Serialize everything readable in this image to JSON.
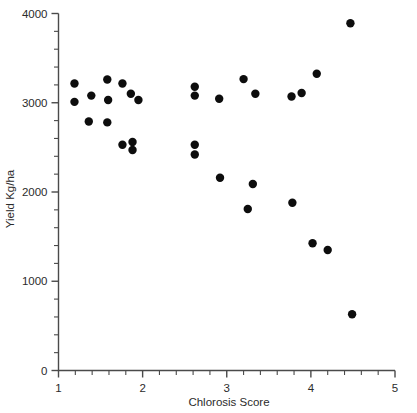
{
  "chart_data": {
    "type": "scatter",
    "title": "",
    "xlabel": "Chlorosis Score",
    "ylabel": "Yield Kg/ha",
    "xlim": [
      1,
      5
    ],
    "ylim": [
      0,
      4000
    ],
    "x_ticks_major": [
      1,
      2,
      3,
      4,
      5
    ],
    "x_tick_labels": [
      "1",
      "2",
      "3",
      "4",
      "5"
    ],
    "x_minor_step": 0.2,
    "y_ticks_major": [
      0,
      1000,
      2000,
      3000,
      4000
    ],
    "y_tick_labels": [
      "0",
      "1000",
      "2000",
      "3000",
      "4000"
    ],
    "y_minor_step": 200,
    "grid": false,
    "legend": "none",
    "marker": "filled-circle",
    "marker_color": "#0d0d0d",
    "marker_size": 4.2,
    "points": [
      {
        "x": 1.19,
        "y": 3215
      },
      {
        "x": 1.19,
        "y": 3010
      },
      {
        "x": 1.39,
        "y": 3080
      },
      {
        "x": 1.36,
        "y": 2790
      },
      {
        "x": 1.58,
        "y": 3260
      },
      {
        "x": 1.59,
        "y": 3030
      },
      {
        "x": 1.58,
        "y": 2780
      },
      {
        "x": 1.76,
        "y": 3215
      },
      {
        "x": 1.86,
        "y": 3100
      },
      {
        "x": 1.76,
        "y": 2530
      },
      {
        "x": 1.88,
        "y": 2560
      },
      {
        "x": 1.88,
        "y": 2470
      },
      {
        "x": 1.95,
        "y": 3030
      },
      {
        "x": 2.62,
        "y": 3180
      },
      {
        "x": 2.62,
        "y": 3080
      },
      {
        "x": 2.62,
        "y": 2530
      },
      {
        "x": 2.62,
        "y": 2420
      },
      {
        "x": 2.91,
        "y": 3045
      },
      {
        "x": 2.92,
        "y": 2160
      },
      {
        "x": 3.2,
        "y": 3265
      },
      {
        "x": 3.25,
        "y": 1810
      },
      {
        "x": 3.34,
        "y": 3100
      },
      {
        "x": 3.31,
        "y": 2090
      },
      {
        "x": 3.77,
        "y": 3070
      },
      {
        "x": 3.89,
        "y": 3110
      },
      {
        "x": 3.78,
        "y": 1880
      },
      {
        "x": 4.07,
        "y": 3325
      },
      {
        "x": 4.02,
        "y": 1425
      },
      {
        "x": 4.2,
        "y": 1350
      },
      {
        "x": 4.47,
        "y": 3890
      },
      {
        "x": 4.49,
        "y": 630
      }
    ]
  }
}
